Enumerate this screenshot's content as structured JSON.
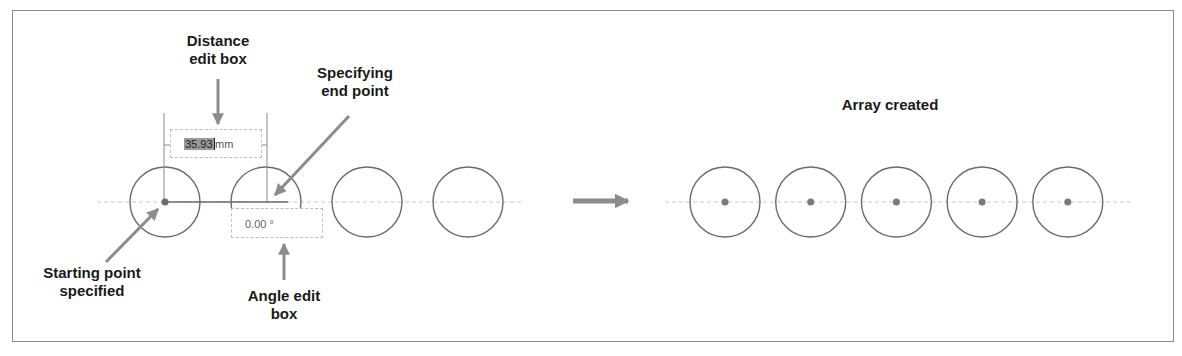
{
  "callouts": {
    "distance_edit_box": "Distance\nedit box",
    "specifying_end_point": "Specifying\nend point",
    "starting_point": "Starting point\nspecified",
    "angle_edit_box": "Angle edit\nbox",
    "array_created": "Array created"
  },
  "distance_box": {
    "value": "35.93",
    "unit": "mm"
  },
  "angle_box": {
    "value": "0.00 °"
  },
  "before_array": {
    "circle_count": 4,
    "selected_center_index": 0
  },
  "after_array": {
    "circle_count": 5
  },
  "colors": {
    "stroke": "#6b6b6b",
    "arrow": "#8c8c8c",
    "axis": "#c8c8c8",
    "text": "#1a1a1a"
  }
}
